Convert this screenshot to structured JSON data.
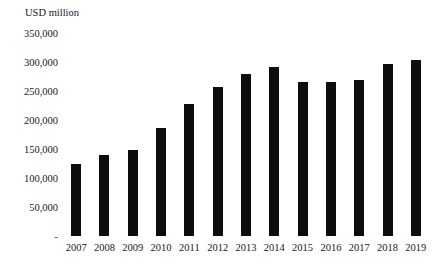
{
  "chart_data": {
    "type": "bar",
    "title": "USD million",
    "xlabel": "",
    "ylabel": "USD million",
    "categories": [
      "2007",
      "2008",
      "2009",
      "2010",
      "2011",
      "2012",
      "2013",
      "2014",
      "2015",
      "2016",
      "2017",
      "2018",
      "2019"
    ],
    "values": [
      125000,
      140000,
      148000,
      187000,
      228000,
      257000,
      280000,
      292000,
      266000,
      265000,
      269000,
      296000,
      304000
    ],
    "ylim": [
      0,
      350000
    ],
    "ytick_labels": [
      "350,000",
      "300,000",
      "250,000",
      "200,000",
      "150,000",
      "100,000",
      "50,000",
      "-"
    ],
    "ytick_values": [
      350000,
      300000,
      250000,
      200000,
      150000,
      100000,
      50000,
      0
    ],
    "grid": false,
    "legend": "none",
    "bar_color": "#0d0d0d",
    "background_color": "#ffffff"
  }
}
